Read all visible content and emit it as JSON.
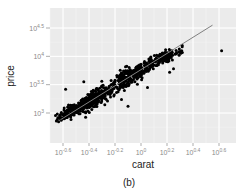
{
  "chart_data": {
    "type": "scatter",
    "caption": "(b)",
    "xlabel": "carat",
    "ylabel": "price",
    "x_scale": "log10",
    "y_scale": "log10",
    "xlim_log10": [
      -0.7,
      0.65
    ],
    "ylim_log10": [
      2.78,
      4.65
    ],
    "x_ticks": [
      {
        "value": -0.6,
        "label_base": "10",
        "label_exp": "-0.6"
      },
      {
        "value": -0.4,
        "label_base": "10",
        "label_exp": "-0.4"
      },
      {
        "value": -0.2,
        "label_base": "10",
        "label_exp": "-0.2"
      },
      {
        "value": 0.0,
        "label_base": "10",
        "label_exp": "0"
      },
      {
        "value": 0.2,
        "label_base": "10",
        "label_exp": "0.2"
      },
      {
        "value": 0.4,
        "label_base": "10",
        "label_exp": "0.4"
      },
      {
        "value": 0.6,
        "label_base": "10",
        "label_exp": "0.6"
      }
    ],
    "y_ticks": [
      {
        "value": 3.0,
        "label_base": "10",
        "label_exp": "3"
      },
      {
        "value": 3.5,
        "label_base": "10",
        "label_exp": "3.5"
      },
      {
        "value": 4.0,
        "label_base": "10",
        "label_exp": "4"
      },
      {
        "value": 4.5,
        "label_base": "10",
        "label_exp": "4.5"
      }
    ],
    "grid": true,
    "background": "#ebebeb",
    "point_color": "#000000",
    "fit_line": {
      "color": "#808080",
      "x1_log10": -0.62,
      "y1_log10": 2.88,
      "x2_log10": 0.55,
      "y2_log10": 4.55
    },
    "clusters": [
      {
        "cx": -0.52,
        "cy": 3.05,
        "sx": 0.06,
        "sy": 0.09,
        "n": 170
      },
      {
        "cx": -0.38,
        "cy": 3.22,
        "sx": 0.045,
        "sy": 0.12,
        "n": 170
      },
      {
        "cx": -0.28,
        "cy": 3.35,
        "sx": 0.05,
        "sy": 0.12,
        "n": 90
      },
      {
        "cx": -0.13,
        "cy": 3.6,
        "sx": 0.035,
        "sy": 0.14,
        "n": 130
      },
      {
        "cx": -0.02,
        "cy": 3.72,
        "sx": 0.04,
        "sy": 0.12,
        "n": 110
      },
      {
        "cx": 0.08,
        "cy": 3.88,
        "sx": 0.04,
        "sy": 0.1,
        "n": 60
      },
      {
        "cx": 0.17,
        "cy": 3.97,
        "sx": 0.03,
        "sy": 0.09,
        "n": 90
      },
      {
        "cx": 0.26,
        "cy": 4.05,
        "sx": 0.04,
        "sy": 0.07,
        "n": 25
      }
    ],
    "outliers": [
      {
        "x": -0.62,
        "y": 2.9
      },
      {
        "x": -0.58,
        "y": 3.42
      },
      {
        "x": -0.44,
        "y": 3.55
      },
      {
        "x": -0.2,
        "y": 3.58
      },
      {
        "x": 0.22,
        "y": 3.72
      },
      {
        "x": 0.25,
        "y": 3.78
      },
      {
        "x": 0.62,
        "y": 4.1
      },
      {
        "x": -0.1,
        "y": 3.12
      },
      {
        "x": 0.05,
        "y": 3.45
      }
    ]
  }
}
